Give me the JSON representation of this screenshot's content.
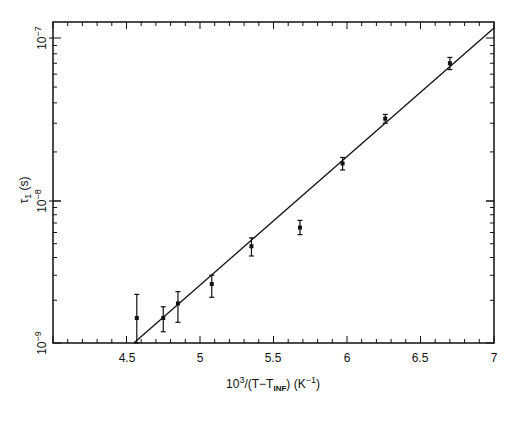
{
  "chart_data": {
    "type": "scatter",
    "title": "",
    "xlabel": "10^3/(T-T_INF) (K^-1)",
    "ylabel": "τ1 (s)",
    "xlim": [
      4.0,
      7.0
    ],
    "ylim": [
      1e-09,
      1.1e-07
    ],
    "yscale": "log",
    "grid": false,
    "legend": null,
    "x_ticks": [
      4.5,
      5,
      5.5,
      6,
      6.5,
      7
    ],
    "x_tick_labels": [
      "4.5",
      "5",
      "5.5",
      "6",
      "6.5",
      "7"
    ],
    "y_ticks": [
      1e-09,
      1e-08,
      1e-07
    ],
    "y_tick_labels": [
      "10^-9",
      "10^-8",
      "10^-7"
    ],
    "series": [
      {
        "name": "measured",
        "x": [
          4.57,
          4.75,
          4.85,
          5.08,
          5.35,
          5.68,
          5.97,
          6.26,
          6.7
        ],
        "y": [
          1.5e-09,
          1.5e-09,
          1.9e-09,
          2.6e-09,
          4.8e-09,
          6.5e-09,
          1.7e-08,
          3.2e-08,
          7e-08
        ],
        "y_err_low": [
          1e-09,
          1.2e-09,
          1.4e-09,
          2.1e-09,
          4.1e-09,
          5.8e-09,
          1.55e-08,
          3e-08,
          6.4e-08
        ],
        "y_err_high": [
          2.2e-09,
          1.8e-09,
          2.3e-09,
          3e-09,
          5.5e-09,
          7.3e-09,
          1.85e-08,
          3.4e-08,
          7.6e-08
        ]
      },
      {
        "name": "fit",
        "type": "line",
        "x": [
          4.55,
          7.0
        ],
        "y": [
          1e-09,
          1.05e-07
        ]
      }
    ]
  },
  "labels": {
    "x_axis": {
      "base": "10",
      "sup": "3",
      "mid": "/(T−T",
      "sub": "INF",
      "end": ") (K",
      "sup2": "−1",
      "close": ")"
    },
    "y_axis": {
      "tau": "τ",
      "sub": "1",
      "unit": " (s)"
    },
    "xticks": [
      "4.5",
      "5",
      "5.5",
      "6",
      "6.5",
      "7"
    ],
    "yticks": [
      {
        "base": "10",
        "exp": "−7"
      },
      {
        "base": "10",
        "exp": "−8"
      },
      {
        "base": "10",
        "exp": "−9"
      }
    ]
  }
}
